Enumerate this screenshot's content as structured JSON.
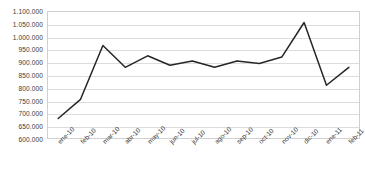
{
  "chart_data": {
    "type": "line",
    "title": "",
    "subtitle": "",
    "xlabel": "",
    "ylabel": "",
    "categories": [
      "ene-10",
      "feb-10",
      "mar-10",
      "abr-10",
      "may-10",
      "jun-10",
      "jul-10",
      "ago-10",
      "sep-10",
      "oct-10",
      "nov-10",
      "dic-10",
      "ene-11",
      "feb-11"
    ],
    "values": [
      680000,
      755000,
      965000,
      880000,
      925000,
      888000,
      905000,
      880000,
      905000,
      895000,
      920000,
      1055000,
      810000,
      880000
    ],
    "series": [
      {
        "name": "serie-1",
        "values": [
          680000,
          755000,
          965000,
          880000,
          925000,
          888000,
          905000,
          880000,
          905000,
          895000,
          920000,
          1055000,
          810000,
          880000
        ]
      }
    ],
    "ylim": [
      600000,
      1100000
    ],
    "ytick_step": 50000,
    "ytick_labels": [
      "1.100.000",
      "1.050.000",
      "1.000.000",
      "950.000",
      "900.000",
      "850.000",
      "800.000",
      "750.000",
      "700.000",
      "650.000",
      "600.000"
    ],
    "ytick_values": [
      1100000,
      1050000,
      1000000,
      950000,
      900000,
      850000,
      800000,
      750000,
      700000,
      650000,
      600000
    ],
    "grid": true,
    "grid_axis": "y",
    "legend": false,
    "legend_position": "none",
    "line_color": "#262626",
    "grid_color": "#dcdcdc",
    "frame_color": "#d0d0d0",
    "background_color": "#ffffff",
    "markers": false,
    "annotations": []
  }
}
